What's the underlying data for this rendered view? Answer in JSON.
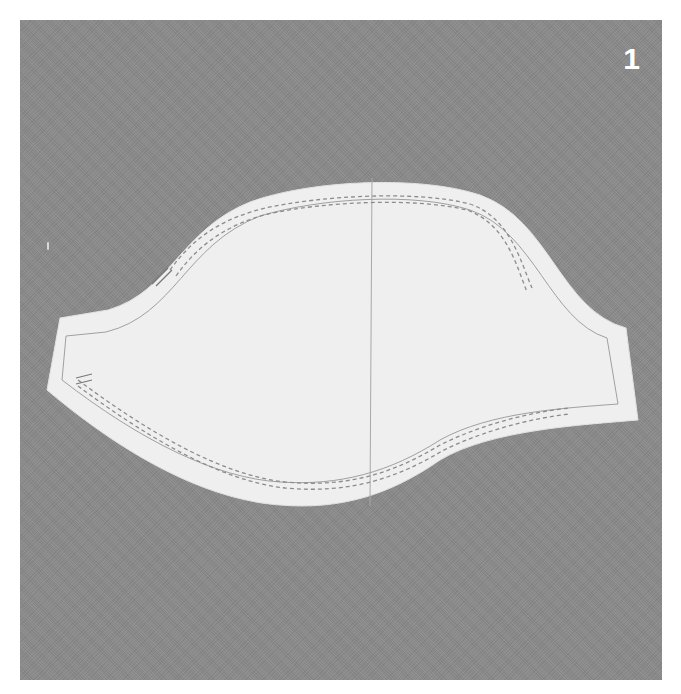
{
  "figure": {
    "step_number": "1",
    "colors": {
      "background": "#8a8a8a",
      "pattern_paper": "#efefef",
      "lines": "#9a9a9a",
      "page": "#ffffff",
      "number": "#ffffff"
    }
  }
}
